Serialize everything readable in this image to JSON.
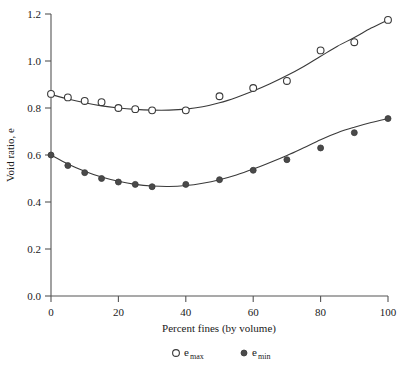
{
  "chart_data": {
    "type": "scatter",
    "title": "",
    "xlabel": "Percent fines (by volume)",
    "ylabel": "Void ratio, e",
    "xlim": [
      0,
      100
    ],
    "ylim": [
      0.0,
      1.2
    ],
    "grid": false,
    "legend_position": "bottom-center",
    "xticks": [
      "0",
      "20",
      "40",
      "60",
      "80",
      "100"
    ],
    "xtick_values": [
      0,
      20,
      40,
      60,
      80,
      100
    ],
    "yticks": [
      "0.0",
      "0.2",
      "0.4",
      "0.6",
      "0.8",
      "1.0",
      "1.2"
    ],
    "ytick_values": [
      0.0,
      0.2,
      0.4,
      0.6,
      0.8,
      1.0,
      1.2
    ],
    "x": [
      0,
      5,
      10,
      15,
      20,
      25,
      30,
      40,
      50,
      60,
      70,
      80,
      90,
      100
    ],
    "series": [
      {
        "name": "e_max",
        "legend_label": "e",
        "legend_subscript": "max",
        "marker": "open-circle",
        "values": [
          0.86,
          0.845,
          0.83,
          0.825,
          0.8,
          0.795,
          0.79,
          0.79,
          0.85,
          0.885,
          0.915,
          1.045,
          1.08,
          1.175
        ],
        "fit_curve": [
          [
            0,
            0.858
          ],
          [
            5,
            0.838
          ],
          [
            10,
            0.822
          ],
          [
            15,
            0.809
          ],
          [
            20,
            0.8
          ],
          [
            25,
            0.794
          ],
          [
            30,
            0.791
          ],
          [
            35,
            0.791
          ],
          [
            40,
            0.795
          ],
          [
            45,
            0.805
          ],
          [
            50,
            0.822
          ],
          [
            55,
            0.845
          ],
          [
            60,
            0.872
          ],
          [
            65,
            0.903
          ],
          [
            70,
            0.938
          ],
          [
            75,
            0.977
          ],
          [
            80,
            1.02
          ],
          [
            85,
            1.063
          ],
          [
            90,
            1.1
          ],
          [
            95,
            1.14
          ],
          [
            100,
            1.175
          ]
        ]
      },
      {
        "name": "e_min",
        "legend_label": "e",
        "legend_subscript": "min",
        "marker": "filled-circle",
        "values": [
          0.6,
          0.555,
          0.525,
          0.5,
          0.485,
          0.475,
          0.465,
          0.475,
          0.495,
          0.535,
          0.58,
          0.63,
          0.695,
          0.755
        ],
        "fit_curve": [
          [
            0,
            0.6
          ],
          [
            5,
            0.562
          ],
          [
            10,
            0.531
          ],
          [
            15,
            0.506
          ],
          [
            20,
            0.488
          ],
          [
            25,
            0.475
          ],
          [
            30,
            0.468
          ],
          [
            35,
            0.466
          ],
          [
            40,
            0.47
          ],
          [
            45,
            0.48
          ],
          [
            50,
            0.495
          ],
          [
            55,
            0.515
          ],
          [
            60,
            0.54
          ],
          [
            65,
            0.568
          ],
          [
            70,
            0.598
          ],
          [
            75,
            0.631
          ],
          [
            80,
            0.665
          ],
          [
            85,
            0.695
          ],
          [
            90,
            0.718
          ],
          [
            95,
            0.738
          ],
          [
            100,
            0.755
          ]
        ]
      }
    ]
  },
  "axis": {
    "x_label": "Percent fines (by volume)",
    "y_label": "Void ratio, e"
  },
  "legend": {
    "items": [
      {
        "marker": "open-circle",
        "label": "e",
        "sub": "max"
      },
      {
        "marker": "filled-circle",
        "label": "e",
        "sub": "min"
      }
    ]
  },
  "colors": {
    "axis": "#555555",
    "curve": "#3a3a3a",
    "marker_fill": "#4a4a4a",
    "background": "#ffffff"
  }
}
